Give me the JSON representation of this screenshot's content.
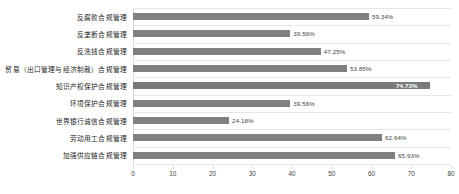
{
  "chart_data": {
    "type": "bar",
    "orientation": "horizontal",
    "title": "",
    "subtitle": "",
    "xlabel": "",
    "ylabel": "",
    "xlim": [
      0,
      80
    ],
    "xticks": [
      0,
      10,
      20,
      30,
      40,
      50,
      60,
      70,
      80
    ],
    "grid": true,
    "grid_axis": "y-category-separators",
    "legend": false,
    "legend_position": "none",
    "bar_color": "#808080",
    "highlight_color": "#7a7a7a",
    "categories": [
      "反腐败合规管理",
      "反垄断合规管理",
      "反洗钱合规管理",
      "贸易（出口管理与经济制裁）合规管理",
      "知识产权保护合规管理",
      "环境保护合规管理",
      "世界银行诚信合规管理",
      "劳动用工合规管理",
      "加强供应链合规管理"
    ],
    "values": [
      59.34,
      39.56,
      47.25,
      53.85,
      74.73,
      39.56,
      24.18,
      62.64,
      65.93
    ],
    "data_labels": [
      "59.34%",
      "39.56%",
      "47.25%",
      "53.85%",
      "74.73%",
      "39.56%",
      "24.18%",
      "62.64%",
      "65.93%"
    ],
    "label_placement": [
      "outside",
      "outside",
      "outside",
      "outside",
      "inside",
      "outside",
      "outside",
      "outside",
      "outside"
    ]
  }
}
